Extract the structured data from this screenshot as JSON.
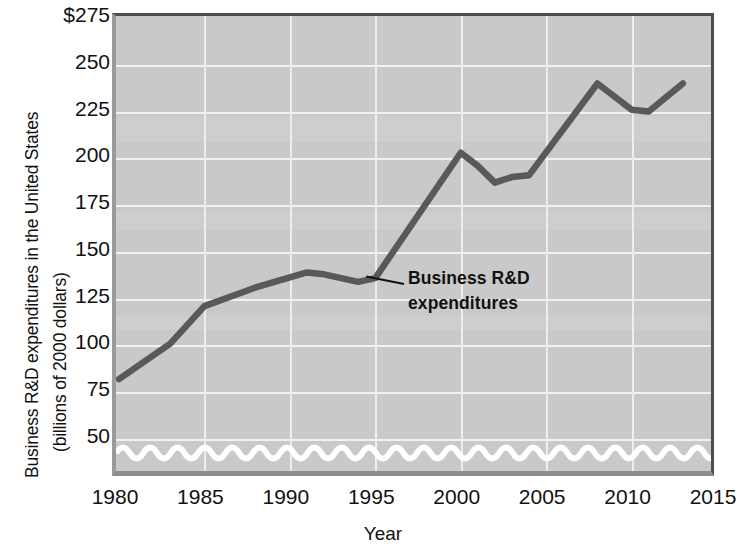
{
  "chart_data": {
    "type": "line",
    "title": "",
    "ylabel": "Business R&D expenditures in the United States (billions of 2000 dollars)",
    "ylabel_line1": "Business R&D expenditures in the United States",
    "ylabel_line2": "(billions of 2000 dollars)",
    "xlabel": "Year",
    "xlim": [
      1980,
      2015
    ],
    "ylim": [
      25,
      275
    ],
    "y_axis_break": true,
    "grid": true,
    "legend": "none",
    "yticks": [
      "$275",
      "250",
      "225",
      "200",
      "175",
      "150",
      "125",
      "100",
      "75",
      "50"
    ],
    "ytick_values": [
      275,
      250,
      225,
      200,
      175,
      150,
      125,
      100,
      75,
      50
    ],
    "xticks": [
      "1980",
      "1985",
      "1990",
      "1995",
      "2000",
      "2005",
      "2010",
      "2015"
    ],
    "xtick_values": [
      1980,
      1985,
      1990,
      1995,
      2000,
      2005,
      2010,
      2015
    ],
    "series": [
      {
        "name": "Business R&D expenditures",
        "color": "#595959",
        "x": [
          1980,
          1983,
          1985,
          1988,
          1991,
          1992,
          1994,
          1995,
          2000,
          2001,
          2002,
          2003,
          2004,
          2008,
          2010,
          2011,
          2013
        ],
        "values": [
          82,
          101,
          121,
          131,
          139,
          138,
          134,
          136,
          203,
          196,
          187,
          190,
          191,
          240,
          226,
          225,
          240
        ]
      }
    ],
    "annotations": [
      {
        "name": "series-callout",
        "line1": "Business R&D",
        "line2": "expenditures",
        "target_x": 1995,
        "target_y": 140
      }
    ],
    "colors": {
      "plot_background": "#c9c9c9",
      "gridline": "#f2f2f2",
      "line": "#595959",
      "text": "#111111",
      "page_background": "#ffffff"
    }
  }
}
